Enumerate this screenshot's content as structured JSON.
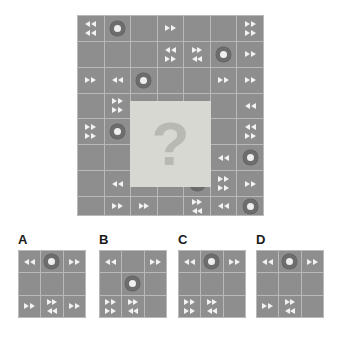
{
  "puzzle": {
    "type": "matrix-reasoning-visual-analogy",
    "main_grid": {
      "rows": 7,
      "cols": 7,
      "cells": [
        [
          {
            "t": "arrows",
            "rows": [
              [
                "l",
                "l"
              ],
              [
                "l",
                "l"
              ]
            ]
          },
          {
            "t": "circle"
          },
          {
            "t": "blank"
          },
          {
            "t": "arrows",
            "rows": [
              [
                "r",
                "r"
              ]
            ]
          },
          {
            "t": "blank"
          },
          {
            "t": "blank"
          },
          {
            "t": "arrows",
            "rows": [
              [
                "r",
                "r"
              ],
              [
                "r",
                "r"
              ]
            ]
          }
        ],
        [
          {
            "t": "blank"
          },
          {
            "t": "blank"
          },
          {
            "t": "blank"
          },
          {
            "t": "arrows",
            "rows": [
              [
                "l",
                "l"
              ],
              [
                "r",
                "r"
              ]
            ]
          },
          {
            "t": "arrows",
            "rows": [
              [
                "r",
                "r"
              ],
              [
                "l",
                "l"
              ]
            ]
          },
          {
            "t": "circle"
          },
          {
            "t": "arrows",
            "rows": [
              [
                "r",
                "r"
              ]
            ]
          }
        ],
        [
          {
            "t": "arrows",
            "rows": [
              [
                "r",
                "r"
              ]
            ]
          },
          {
            "t": "arrows",
            "rows": [
              [
                "l",
                "l"
              ]
            ]
          },
          {
            "t": "circle"
          },
          {
            "t": "blank"
          },
          {
            "t": "blank"
          },
          {
            "t": "arrows",
            "rows": [
              [
                "r",
                "r"
              ]
            ]
          },
          {
            "t": "arrows",
            "rows": [
              [
                "r",
                "r"
              ]
            ]
          }
        ],
        [
          {
            "t": "blank"
          },
          {
            "t": "arrows",
            "rows": [
              [
                "r",
                "r"
              ],
              [
                "r",
                "r"
              ]
            ]
          },
          {
            "t": "masked"
          },
          {
            "t": "masked"
          },
          {
            "t": "masked"
          },
          {
            "t": "blank"
          },
          {
            "t": "arrows",
            "rows": [
              [
                "l",
                "l"
              ]
            ]
          }
        ],
        [
          {
            "t": "arrows",
            "rows": [
              [
                "r",
                "r"
              ],
              [
                "r",
                "r"
              ]
            ]
          },
          {
            "t": "circle"
          },
          {
            "t": "masked"
          },
          {
            "t": "masked"
          },
          {
            "t": "masked"
          },
          {
            "t": "blank"
          },
          {
            "t": "arrows",
            "rows": [
              [
                "l",
                "l"
              ],
              [
                "r",
                "r"
              ]
            ]
          }
        ],
        [
          {
            "t": "blank"
          },
          {
            "t": "blank"
          },
          {
            "t": "masked"
          },
          {
            "t": "masked"
          },
          {
            "t": "masked"
          },
          {
            "t": "arrows",
            "rows": [
              [
                "l",
                "l"
              ]
            ]
          },
          {
            "t": "circle"
          }
        ],
        [
          {
            "t": "blank"
          },
          {
            "t": "arrows",
            "rows": [
              [
                "l",
                "l"
              ]
            ]
          },
          {
            "t": "arrows",
            "rows": [
              [
                "l",
                "l"
              ]
            ]
          },
          {
            "t": "blank"
          },
          {
            "t": "circle"
          },
          {
            "t": "arrows",
            "rows": [
              [
                "r",
                "r"
              ],
              [
                "r",
                "r"
              ]
            ]
          },
          {
            "t": "arrows",
            "rows": [
              [
                "r",
                "r"
              ]
            ]
          }
        ],
        [
          {
            "t": "blank"
          },
          {
            "t": "arrows",
            "rows": [
              [
                "r",
                "r"
              ]
            ]
          },
          {
            "t": "arrows",
            "rows": [
              [
                "r",
                "r"
              ]
            ]
          },
          {
            "t": "blank"
          },
          {
            "t": "arrows",
            "rows": [
              [
                "r",
                "r"
              ],
              [
                "l",
                "l"
              ]
            ]
          },
          {
            "t": "arrows",
            "rows": [
              [
                "l",
                "l"
              ]
            ]
          },
          {
            "t": "circle"
          }
        ]
      ],
      "masked_region": {
        "start_row": 4,
        "start_col": 3,
        "span_rows": 3,
        "span_cols": 3,
        "glyph": "?"
      }
    },
    "options": [
      {
        "label": "A",
        "cells": [
          [
            {
              "t": "arrows",
              "rows": [
                [
                  "l",
                  "l"
                ]
              ]
            },
            {
              "t": "circle"
            },
            {
              "t": "arrows",
              "rows": [
                [
                  "r",
                  "r"
                ]
              ]
            }
          ],
          [
            {
              "t": "blank"
            },
            {
              "t": "blank"
            },
            {
              "t": "blank"
            }
          ],
          [
            {
              "t": "arrows",
              "rows": [
                [
                  "r",
                  "r"
                ]
              ]
            },
            {
              "t": "arrows",
              "rows": [
                [
                  "r",
                  "r"
                ],
                [
                  "l",
                  "l"
                ]
              ]
            },
            {
              "t": "arrows",
              "rows": [
                [
                  "r",
                  "r"
                ]
              ]
            }
          ]
        ]
      },
      {
        "label": "B",
        "cells": [
          [
            {
              "t": "arrows",
              "rows": [
                [
                  "l",
                  "l"
                ]
              ]
            },
            {
              "t": "blank"
            },
            {
              "t": "arrows",
              "rows": [
                [
                  "r",
                  "r"
                ]
              ]
            }
          ],
          [
            {
              "t": "blank"
            },
            {
              "t": "circle"
            },
            {
              "t": "blank"
            }
          ],
          [
            {
              "t": "arrows",
              "rows": [
                [
                  "r",
                  "r"
                ],
                [
                  "r",
                  "r"
                ]
              ]
            },
            {
              "t": "arrows",
              "rows": [
                [
                  "r",
                  "r"
                ],
                [
                  "l",
                  "l"
                ]
              ]
            },
            {
              "t": "blank"
            }
          ]
        ]
      },
      {
        "label": "C",
        "cells": [
          [
            {
              "t": "arrows",
              "rows": [
                [
                  "l",
                  "l"
                ]
              ]
            },
            {
              "t": "circle"
            },
            {
              "t": "arrows",
              "rows": [
                [
                  "r",
                  "r"
                ]
              ]
            }
          ],
          [
            {
              "t": "blank"
            },
            {
              "t": "blank"
            },
            {
              "t": "blank"
            }
          ],
          [
            {
              "t": "arrows",
              "rows": [
                [
                  "r",
                  "r"
                ],
                [
                  "r",
                  "r"
                ]
              ]
            },
            {
              "t": "arrows",
              "rows": [
                [
                  "r",
                  "r"
                ],
                [
                  "l",
                  "l"
                ]
              ]
            },
            {
              "t": "blank"
            }
          ]
        ]
      },
      {
        "label": "D",
        "cells": [
          [
            {
              "t": "arrows",
              "rows": [
                [
                  "l",
                  "l"
                ]
              ]
            },
            {
              "t": "circle"
            },
            {
              "t": "arrows",
              "rows": [
                [
                  "r",
                  "r"
                ]
              ]
            }
          ],
          [
            {
              "t": "blank"
            },
            {
              "t": "blank"
            },
            {
              "t": "blank"
            }
          ],
          [
            {
              "t": "arrows",
              "rows": [
                [
                  "r",
                  "r"
                ]
              ]
            },
            {
              "t": "arrows",
              "rows": [
                [
                  "r",
                  "r"
                ],
                [
                  "l",
                  "l"
                ]
              ]
            },
            {
              "t": "blank"
            }
          ]
        ]
      }
    ]
  },
  "colors": {
    "page_background": "#ffffff",
    "cell_fill": "#8e8e8e",
    "grid_line": "#b9b9b9",
    "masked_fill": "#d8d8d2",
    "question_mark": "#b9b9b3",
    "arrow_fill": "#f2f2f2",
    "circle_outer": "#6d6d6d",
    "circle_inner": "#efefef",
    "label_text": "#1a1a1a"
  }
}
